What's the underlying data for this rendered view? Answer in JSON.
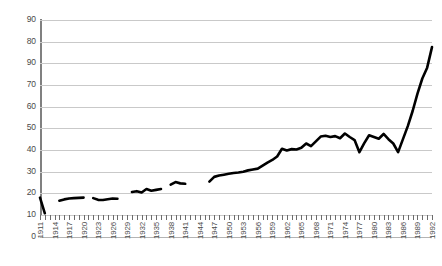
{
  "chart_data": {
    "type": "line",
    "title": "",
    "subtitle": "",
    "xlabel": "",
    "ylabel": "",
    "xlim": [
      1911,
      1992
    ],
    "ylim": [
      0,
      90
    ],
    "grid": true,
    "legend": false,
    "legend_position": "none",
    "y_ticks": [
      90,
      80,
      90,
      70,
      60,
      50,
      40,
      30,
      20,
      10,
      0
    ],
    "y_tick_note": "third label from top reads 90 as printed (appears to be a typo for 90-scale sequence)",
    "y_tick_interval": 10,
    "x_tick_interval_years": 1,
    "x_label_interval_years": 3,
    "x_tick_labels": [
      "1911",
      "1914",
      "1917",
      "1920",
      "1923",
      "1926",
      "1929",
      "1932",
      "1935",
      "1938",
      "1941",
      "1944",
      "1947",
      "1950",
      "1953",
      "1956",
      "1959",
      "1962",
      "1965",
      "1968",
      "1971",
      "1974",
      "1977",
      "1980",
      "1983",
      "1986",
      "1989",
      "1992"
    ],
    "series": [
      {
        "name": "series-1",
        "color": "#000000",
        "has_gaps": true,
        "segments": [
          {
            "name": "segment-1911-1912",
            "x": [
              1911,
              1912
            ],
            "values": [
              8.0,
              0.8
            ]
          },
          {
            "name": "segment-1915-1920",
            "x": [
              1915,
              1916,
              1917,
              1918,
              1919,
              1920
            ],
            "values": [
              6.6,
              7.2,
              7.6,
              7.8,
              7.9,
              8.0
            ]
          },
          {
            "name": "segment-1922-1927",
            "x": [
              1922,
              1923,
              1924,
              1925,
              1926,
              1927
            ],
            "values": [
              7.8,
              7.0,
              6.9,
              7.3,
              7.6,
              7.5
            ]
          },
          {
            "name": "segment-1930-1936",
            "x": [
              1930,
              1931,
              1932,
              1933,
              1934,
              1935,
              1936
            ],
            "values": [
              10.6,
              11.0,
              10.4,
              12.0,
              11.2,
              11.6,
              12.0
            ]
          },
          {
            "name": "segment-1938-1941",
            "x": [
              1938,
              1939,
              1940,
              1941
            ],
            "values": [
              14.0,
              15.2,
              14.6,
              14.4
            ]
          },
          {
            "name": "segment-1946-1992",
            "x": [
              1946,
              1947,
              1948,
              1949,
              1950,
              1951,
              1952,
              1953,
              1954,
              1955,
              1956,
              1957,
              1958,
              1959,
              1960,
              1961,
              1962,
              1963,
              1964,
              1965,
              1966,
              1967,
              1968,
              1969,
              1970,
              1971,
              1972,
              1973,
              1974,
              1975,
              1976,
              1977,
              1978,
              1979,
              1980,
              1981,
              1982,
              1983,
              1984,
              1985,
              1986,
              1987,
              1988,
              1989,
              1990,
              1991,
              1992
            ],
            "values": [
              15.4,
              17.6,
              18.2,
              18.6,
              19.0,
              19.4,
              19.6,
              20.0,
              20.6,
              21.0,
              21.4,
              22.8,
              24.2,
              25.4,
              27.0,
              30.6,
              29.8,
              30.4,
              30.2,
              31.0,
              33.0,
              31.8,
              34.0,
              36.2,
              36.6,
              36.0,
              36.4,
              35.4,
              37.6,
              36.0,
              34.6,
              29.0,
              33.2,
              36.8,
              36.0,
              35.2,
              37.4,
              35.0,
              33.0,
              29.0,
              35.0,
              41.0,
              48.0,
              56.0,
              63.0,
              68.0,
              77.5
            ]
          }
        ]
      }
    ]
  }
}
